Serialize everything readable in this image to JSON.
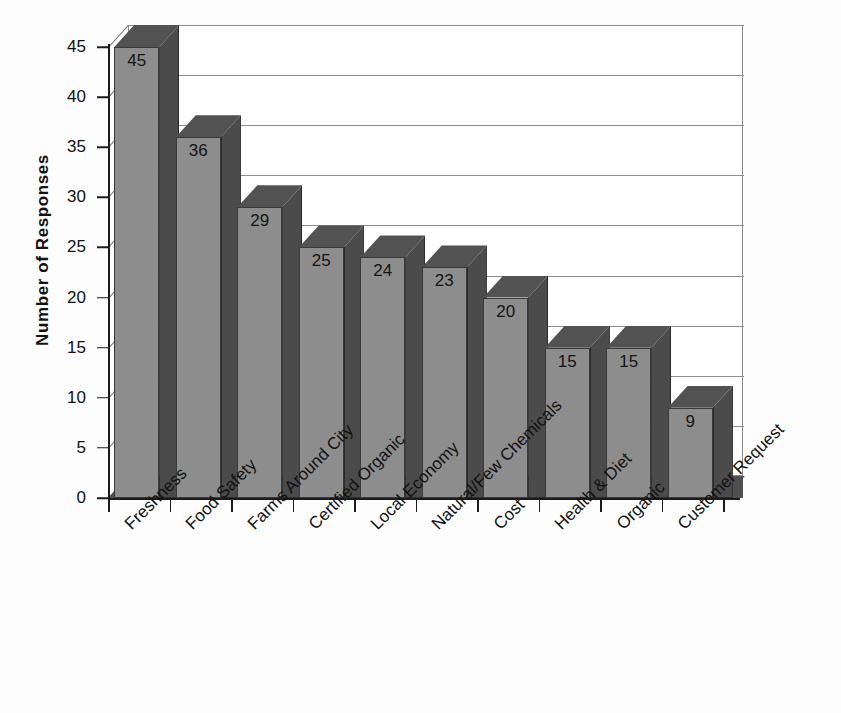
{
  "chart_data": {
    "type": "bar",
    "title": "",
    "subtitle": "",
    "xlabel": "",
    "ylabel": "Number of Responses",
    "ylim": [
      0,
      45
    ],
    "ytick_step": 5,
    "grid": true,
    "legend": "none",
    "style": "3d-column",
    "orientation": "vertical",
    "label_rotation": -45,
    "categories": [
      "Freshness",
      "Food Safety",
      "Farms Around City",
      "Certified Organic",
      "Local Economy",
      "Natural/Few Chemicals",
      "Cost",
      "Health & Diet",
      "Organic",
      "Customer Request"
    ],
    "values": [
      45,
      36,
      29,
      25,
      24,
      23,
      20,
      15,
      15,
      9
    ],
    "data_labels": [
      "45",
      "36",
      "29",
      "25",
      "24",
      "23",
      "20",
      "15",
      "15",
      "9"
    ],
    "ytick_labels": [
      "45",
      "40",
      "35",
      "30",
      "25",
      "20",
      "15",
      "10",
      "5",
      "0"
    ],
    "ytick_values": [
      45,
      40,
      35,
      30,
      25,
      20,
      15,
      10,
      5,
      0
    ]
  },
  "colors": {
    "bar_front": "#8d8d8d",
    "bar_side": "#4b4b4b",
    "bar_top": "#525252",
    "floor": "#4f4f4f",
    "gridline": "#8c8c8c",
    "axis": "#1b1b1b",
    "text": "#111111",
    "background": "#fdfdfd"
  }
}
